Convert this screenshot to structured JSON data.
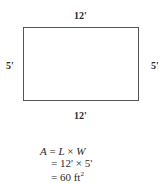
{
  "diagram": {
    "shape": "rectangle",
    "dimensions": {
      "top": "12'",
      "bottom": "12'",
      "left": "5'",
      "right": "5'"
    }
  },
  "formula": {
    "line1": {
      "lhs": "A",
      "eq": " = ",
      "L": "L",
      "times": " × ",
      "W": "W"
    },
    "line2": "= 12' × 5'",
    "line3_prefix": "= 60 ft",
    "line3_sup": "2"
  }
}
